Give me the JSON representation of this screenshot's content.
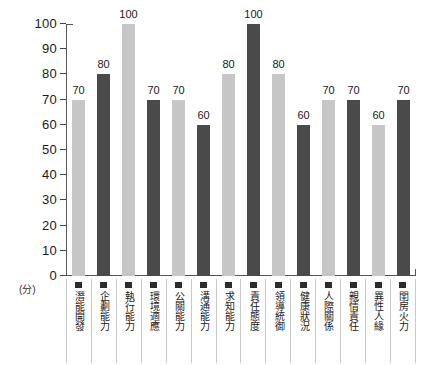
{
  "chart_data": {
    "type": "bar",
    "title": "",
    "xlabel": "",
    "ylabel": "(分)",
    "ylim": [
      0,
      100
    ],
    "grid": false,
    "legend": "none",
    "y_ticks": [
      "100",
      "90",
      "80",
      "70",
      "60",
      "50",
      "40",
      "30",
      "20",
      "10",
      "0"
    ],
    "categories": [
      "潛能開發",
      "企劃能力",
      "執行能力",
      "環境適應",
      "公關能力",
      "溝通能力",
      "求知能力",
      "責任態度",
      "領導統御",
      "健康狀況",
      "人際關係",
      "親情責任",
      "異性人緣",
      "閨房火力"
    ],
    "values": [
      70,
      80,
      100,
      70,
      70,
      60,
      80,
      100,
      80,
      60,
      70,
      70,
      60,
      70
    ],
    "bar_colors": [
      "#c6c6c6",
      "#4a4a4a",
      "#c6c6c6",
      "#4a4a4a",
      "#c6c6c6",
      "#4a4a4a",
      "#c6c6c6",
      "#4a4a4a",
      "#c6c6c6",
      "#4a4a4a",
      "#c6c6c6",
      "#4a4a4a",
      "#c6c6c6",
      "#4a4a4a"
    ],
    "palette": {
      "light_bar": "#c6c6c6",
      "dark_bar": "#4a4a4a",
      "axis": "#555555",
      "text": "#1a1a1a",
      "background": "#ffffff"
    }
  }
}
